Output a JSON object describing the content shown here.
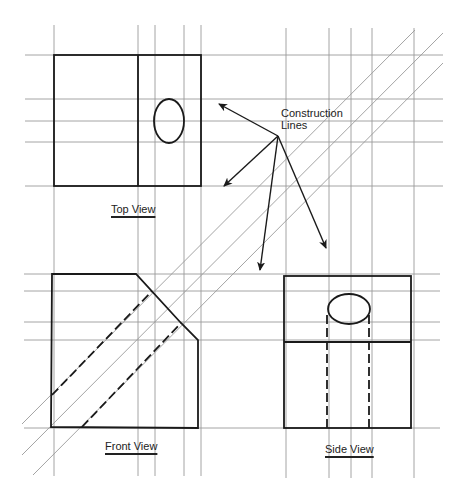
{
  "colors": {
    "construction": "#9a9a9a",
    "object": "#1a1a1a",
    "background": "#ffffff"
  },
  "labels": {
    "construction": [
      "Construction",
      "Lines"
    ],
    "top_view": "Top View",
    "front_view": "Front View",
    "side_view": "Side View"
  },
  "construction_lines": {
    "vertical": [
      {
        "x": 54,
        "y1": 25,
        "y2": 476
      },
      {
        "x": 138,
        "y1": 25,
        "y2": 476
      },
      {
        "x": 155,
        "y1": 25,
        "y2": 476
      },
      {
        "x": 184,
        "y1": 25,
        "y2": 476
      },
      {
        "x": 201,
        "y1": 25,
        "y2": 476
      },
      {
        "x": 286,
        "y1": 28,
        "y2": 478
      },
      {
        "x": 329,
        "y1": 28,
        "y2": 478
      },
      {
        "x": 351,
        "y1": 28,
        "y2": 478
      },
      {
        "x": 372,
        "y1": 28,
        "y2": 478
      },
      {
        "x": 414,
        "y1": 28,
        "y2": 478
      }
    ],
    "horizontal": [
      {
        "y": 55,
        "x1": 25,
        "x2": 443
      },
      {
        "y": 99,
        "x1": 25,
        "x2": 443
      },
      {
        "y": 121,
        "x1": 25,
        "x2": 443
      },
      {
        "y": 142,
        "x1": 25,
        "x2": 443
      },
      {
        "y": 186,
        "x1": 25,
        "x2": 443
      },
      {
        "y": 274,
        "x1": 24,
        "x2": 440
      },
      {
        "y": 291,
        "x1": 24,
        "x2": 440
      },
      {
        "y": 322,
        "x1": 24,
        "x2": 440
      },
      {
        "y": 340,
        "x1": 24,
        "x2": 440
      },
      {
        "y": 428,
        "x1": 24,
        "x2": 440
      }
    ],
    "diagonal": [
      {
        "x1": 22,
        "y1": 424,
        "x2": 415,
        "y2": 30
      },
      {
        "x1": 22,
        "y1": 455,
        "x2": 443,
        "y2": 33
      },
      {
        "x1": 33,
        "y1": 475,
        "x2": 443,
        "y2": 63
      }
    ]
  },
  "top_view": {
    "rect": {
      "x": 54,
      "y": 55,
      "w": 147,
      "h": 131
    },
    "divider": {
      "x": 138,
      "y1": 55,
      "y2": 186
    },
    "hole": {
      "cx": 169,
      "cy": 121,
      "rx": 15,
      "ry": 22
    }
  },
  "front_view": {
    "outline": "52,274 136,274 181,323 198,340 198,428 51,427",
    "hidden_lines": [
      {
        "x1": 52,
        "y1": 395,
        "x2": 152,
        "y2": 291
      },
      {
        "x1": 82,
        "y1": 427,
        "x2": 181,
        "y2": 323
      }
    ]
  },
  "side_view": {
    "rect": {
      "x": 284,
      "y": 276,
      "w": 127,
      "h": 152
    },
    "divider": {
      "y": 342,
      "x1": 284,
      "x2": 411
    },
    "hole": {
      "cx": 349,
      "cy": 309,
      "rx": 21,
      "ry": 15
    },
    "hidden_lines": [
      {
        "x": 327,
        "y1": 315,
        "y2": 428
      },
      {
        "x": 369,
        "y1": 315,
        "y2": 428
      }
    ]
  },
  "leader_arrows": {
    "origin": {
      "x": 278,
      "y": 136
    },
    "tips": [
      {
        "x": 219,
        "y": 104
      },
      {
        "x": 224,
        "y": 186
      },
      {
        "x": 260,
        "y": 270
      },
      {
        "x": 326,
        "y": 248
      }
    ]
  }
}
